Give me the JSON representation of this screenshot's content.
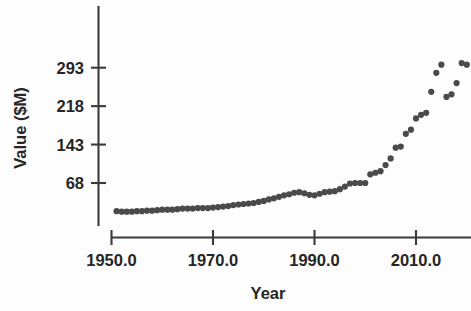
{
  "chart_data": {
    "type": "scatter",
    "title": "",
    "xlabel": "Year",
    "ylabel": "Value ($M)",
    "xlim": [
      1948.0,
      2020.5
    ],
    "ylim": [
      0,
      375
    ],
    "grid": false,
    "legend": null,
    "xticks": [
      "1950.0",
      "1970.0",
      "1990.0",
      "2010.0"
    ],
    "xtick_values": [
      1950.0,
      1970.0,
      1990.0,
      2010.0
    ],
    "yticks": [
      "68",
      "143",
      "218",
      "293"
    ],
    "ytick_values": [
      68,
      143,
      218,
      293
    ],
    "marker_color": "#4a4a4a",
    "axis_color": "#3b3b3b",
    "background_color": "#fdfdfd",
    "x": [
      1951,
      1952,
      1953,
      1954,
      1955,
      1956,
      1957,
      1958,
      1959,
      1960,
      1961,
      1962,
      1963,
      1964,
      1965,
      1966,
      1967,
      1968,
      1969,
      1970,
      1971,
      1972,
      1973,
      1974,
      1975,
      1976,
      1977,
      1978,
      1979,
      1980,
      1981,
      1982,
      1983,
      1984,
      1985,
      1986,
      1987,
      1988,
      1989,
      1990,
      1991,
      1992,
      1993,
      1994,
      1995,
      1996,
      1997,
      1998,
      1999,
      2000,
      2001,
      2002,
      2003,
      2004,
      2005,
      2006,
      2007,
      2008,
      2009,
      2010,
      2011,
      2012,
      2013,
      2014,
      2015,
      2016,
      2017,
      2018,
      2019,
      2020
    ],
    "y": [
      13,
      12,
      12,
      12,
      13,
      13,
      14,
      14,
      15,
      16,
      16,
      16,
      17,
      18,
      18,
      18,
      19,
      19,
      19,
      20,
      21,
      22,
      23,
      25,
      26,
      27,
      28,
      29,
      31,
      33,
      36,
      38,
      41,
      44,
      46,
      49,
      50,
      48,
      45,
      44,
      47,
      50,
      51,
      52,
      56,
      61,
      67,
      68,
      68,
      68,
      85,
      88,
      91,
      103,
      116,
      137,
      139,
      164,
      172,
      194,
      201,
      205,
      246,
      283,
      299,
      236,
      241,
      263,
      302,
      299
    ],
    "annotations": []
  },
  "axis": {
    "x_title": "Year",
    "y_title": "Value ($M)"
  }
}
